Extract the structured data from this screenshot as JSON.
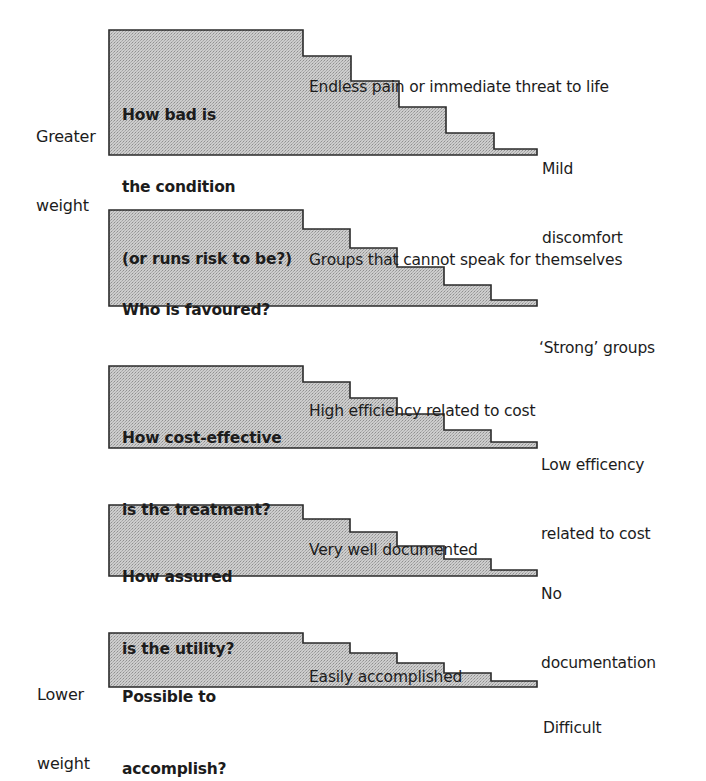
{
  "side_labels": {
    "top": [
      "Greater",
      "weight"
    ],
    "bottom": [
      "Lower",
      "weight"
    ]
  },
  "colors": {
    "fill": "#c9c9c9",
    "fill_dot": "#9a9a9a",
    "outline": "#2a2a2a",
    "text": "#1c1c1c"
  },
  "criteria": [
    {
      "question": [
        "How bad is",
        "the condition",
        "(or runs risk to be?)"
      ],
      "high_label": [
        "Endless pain or immediate threat to life"
      ],
      "low_label": [
        "Mild",
        "discomfort"
      ],
      "geometry": {
        "left": 109,
        "top": 30,
        "bottom": 155,
        "step_x": [
          303,
          351,
          399,
          446,
          494,
          537
        ],
        "step_y": [
          56,
          81,
          107,
          133,
          149
        ]
      }
    },
    {
      "question": [
        "Who is favoured?"
      ],
      "high_label": [
        "Groups that cannot speak for themselves"
      ],
      "low_label": [
        "‘Strong’ groups"
      ],
      "geometry": {
        "left": 109,
        "top": 210,
        "bottom": 306,
        "step_x": [
          303,
          350,
          397,
          444,
          491,
          537
        ],
        "step_y": [
          229,
          248,
          267,
          285,
          300
        ]
      }
    },
    {
      "question": [
        "How cost-effective",
        "is the treatment?"
      ],
      "high_label": [
        "High efficiency related to cost"
      ],
      "low_label": [
        "Low efficency",
        "related to cost"
      ],
      "geometry": {
        "left": 109,
        "top": 366,
        "bottom": 448,
        "step_x": [
          303,
          350,
          397,
          444,
          491,
          537
        ],
        "step_y": [
          382,
          398,
          414,
          430,
          442
        ]
      }
    },
    {
      "question": [
        "How assured",
        "is the utility?"
      ],
      "high_label": [
        "Very well documented"
      ],
      "low_label": [
        "No",
        "documentation"
      ],
      "geometry": {
        "left": 109,
        "top": 505,
        "bottom": 576,
        "step_x": [
          303,
          350,
          397,
          444,
          491,
          537
        ],
        "step_y": [
          519,
          532,
          546,
          559,
          570
        ]
      }
    },
    {
      "question": [
        "Possible to",
        "accomplish?"
      ],
      "high_label": [
        "Easily accomplished"
      ],
      "low_label": [
        "Difficult"
      ],
      "geometry": {
        "left": 109,
        "top": 633,
        "bottom": 687,
        "step_x": [
          303,
          350,
          397,
          444,
          491,
          537
        ],
        "step_y": [
          643,
          653,
          663,
          673,
          681
        ]
      }
    }
  ]
}
